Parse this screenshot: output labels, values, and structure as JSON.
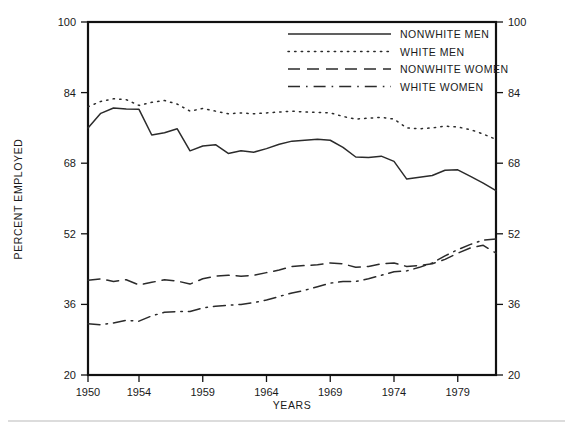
{
  "chart_data": {
    "type": "line",
    "title": "",
    "xlabel": "YEARS",
    "ylabel": "PERCENT EMPLOYED",
    "xlim": [
      1950,
      1982
    ],
    "ylim": [
      20,
      100
    ],
    "ytick_values": [
      20,
      36,
      52,
      68,
      84,
      100
    ],
    "ytick_labels": [
      "20",
      "36",
      "52",
      "68",
      "84",
      "100"
    ],
    "ytick_labels_right": [
      "20",
      "36",
      "52",
      "68",
      "84",
      "100"
    ],
    "xtick_values": [
      1950,
      1954,
      1959,
      1964,
      1969,
      1974,
      1979
    ],
    "xtick_labels": [
      "1950",
      "1954",
      "1959",
      "1964",
      "1969",
      "1974",
      "1979"
    ],
    "grid": false,
    "legend_position": "top-right",
    "dual_y_axis": true,
    "x": [
      1950,
      1951,
      1952,
      1953,
      1954,
      1955,
      1956,
      1957,
      1958,
      1959,
      1960,
      1961,
      1962,
      1963,
      1964,
      1965,
      1966,
      1967,
      1968,
      1969,
      1970,
      1971,
      1972,
      1973,
      1974,
      1975,
      1976,
      1977,
      1978,
      1979,
      1980,
      1981,
      1982
    ],
    "series": [
      {
        "name": "NONWHITE MEN",
        "style": "solid",
        "values": [
          76.0,
          79.3,
          80.5,
          80.3,
          80.2,
          74.4,
          74.9,
          75.8,
          70.8,
          71.9,
          72.2,
          70.2,
          70.8,
          70.5,
          71.3,
          72.3,
          73.0,
          73.2,
          73.4,
          73.2,
          71.6,
          69.4,
          69.3,
          69.6,
          68.4,
          64.4,
          64.8,
          65.2,
          66.4,
          66.5,
          65.0,
          63.5,
          61.8
        ]
      },
      {
        "name": "WHITE MEN",
        "style": "dotted",
        "values": [
          80.8,
          82.0,
          82.6,
          82.4,
          81.1,
          81.8,
          82.2,
          81.4,
          79.8,
          80.4,
          79.8,
          79.2,
          79.4,
          79.2,
          79.4,
          79.6,
          79.8,
          79.6,
          79.5,
          79.4,
          78.6,
          78.0,
          78.2,
          78.4,
          78.0,
          76.0,
          75.8,
          76.0,
          76.4,
          76.2,
          75.6,
          74.6,
          73.4
        ]
      },
      {
        "name": "NONWHITE WOMEN",
        "style": "dashed",
        "values": [
          41.5,
          41.8,
          41.2,
          41.6,
          40.4,
          41.0,
          41.6,
          41.3,
          40.6,
          41.8,
          42.4,
          42.6,
          42.4,
          42.6,
          43.2,
          43.8,
          44.6,
          44.8,
          45.0,
          45.4,
          45.2,
          44.4,
          44.6,
          45.2,
          45.4,
          44.6,
          44.8,
          45.2,
          46.2,
          47.6,
          48.8,
          49.4,
          47.6
        ]
      },
      {
        "name": "WHITE WOMEN",
        "style": "dashdot",
        "values": [
          31.6,
          31.4,
          31.8,
          32.4,
          32.2,
          33.4,
          34.2,
          34.4,
          34.4,
          35.2,
          35.6,
          35.8,
          36.0,
          36.4,
          37.0,
          37.8,
          38.6,
          39.2,
          40.0,
          40.8,
          41.2,
          41.2,
          41.8,
          42.6,
          43.4,
          43.6,
          44.4,
          45.4,
          47.0,
          48.4,
          49.6,
          50.6,
          50.8
        ]
      }
    ]
  },
  "legend": {
    "items": [
      {
        "label": "NONWHITE MEN",
        "style": "solid"
      },
      {
        "label": "WHITE MEN",
        "style": "dotted"
      },
      {
        "label": "NONWHITE WOMEN",
        "style": "dashed"
      },
      {
        "label": "WHITE WOMEN",
        "style": "dashdot"
      }
    ]
  },
  "axes": {
    "y_title": "PERCENT EMPLOYED",
    "x_title": "YEARS"
  },
  "colors": {
    "line": "#2b2b2b",
    "frame": "#111111",
    "text": "#1a1a1a",
    "background": "#ffffff"
  }
}
